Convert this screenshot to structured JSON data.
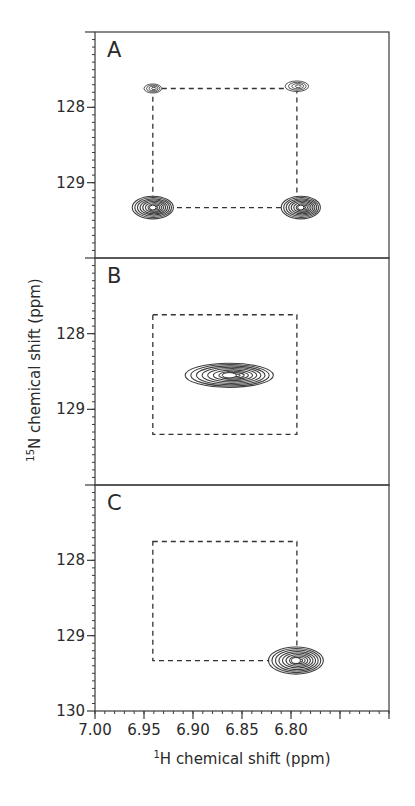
{
  "chart_data": {
    "type": "heatmap",
    "subtype": "2D NMR contour spectra (stacked panels)",
    "title": "",
    "xlabel": "1H chemical shift (ppm)",
    "xlabel_parts": {
      "sup": "1",
      "main": "H chemical shift (ppm)"
    },
    "ylabel": "15N chemical shift (ppm)",
    "ylabel_parts": {
      "sup": "15",
      "main": "N chemical shift (ppm)"
    },
    "xlim": [
      7.0,
      6.7
    ],
    "x_reversed": true,
    "x_ticks": [
      7.0,
      6.95,
      6.9,
      6.85,
      6.8,
      6.75,
      6.7
    ],
    "x_tick_labels": [
      "7.00",
      "6.95",
      "6.90",
      "6.85",
      "6.80",
      "",
      ""
    ],
    "x_minor_step": 0.01,
    "ylim": [
      127.0,
      130.0
    ],
    "y_reversed": true,
    "y_minor_step": 0.1,
    "grid": false,
    "legend": null,
    "reference_box": {
      "style": "dashed",
      "x": [
        6.941,
        6.794
      ],
      "y": [
        127.75,
        129.33
      ]
    },
    "panels": [
      {
        "label": "A",
        "y_ticks": [
          128,
          129
        ],
        "y_tick_labels": [
          "128",
          "129"
        ],
        "peaks": [
          {
            "x": 6.941,
            "y": 127.75,
            "intensity": "weak",
            "width_ppm": 0.018,
            "height_ppm": 0.12
          },
          {
            "x": 6.794,
            "y": 127.72,
            "intensity": "weak",
            "width_ppm": 0.024,
            "height_ppm": 0.14
          },
          {
            "x": 6.941,
            "y": 129.33,
            "intensity": "strong",
            "width_ppm": 0.042,
            "height_ppm": 0.3
          },
          {
            "x": 6.79,
            "y": 129.33,
            "intensity": "strong",
            "width_ppm": 0.04,
            "height_ppm": 0.3
          }
        ]
      },
      {
        "label": "B",
        "y_ticks": [
          128,
          129
        ],
        "y_tick_labels": [
          "128",
          "129"
        ],
        "peaks": [
          {
            "x": 6.863,
            "y": 128.55,
            "intensity": "strong",
            "width_ppm": 0.09,
            "height_ppm": 0.32
          }
        ]
      },
      {
        "label": "C",
        "y_ticks": [
          128,
          129,
          130
        ],
        "y_tick_labels": [
          "128",
          "129",
          "130"
        ],
        "peaks": [
          {
            "x": 6.795,
            "y": 129.33,
            "intensity": "strong",
            "width_ppm": 0.056,
            "height_ppm": 0.36
          }
        ]
      }
    ]
  },
  "colors": {
    "axis": "#3a3a3a",
    "contour": "#2b2b2b",
    "dash": "#333333",
    "background": "#ffffff"
  }
}
